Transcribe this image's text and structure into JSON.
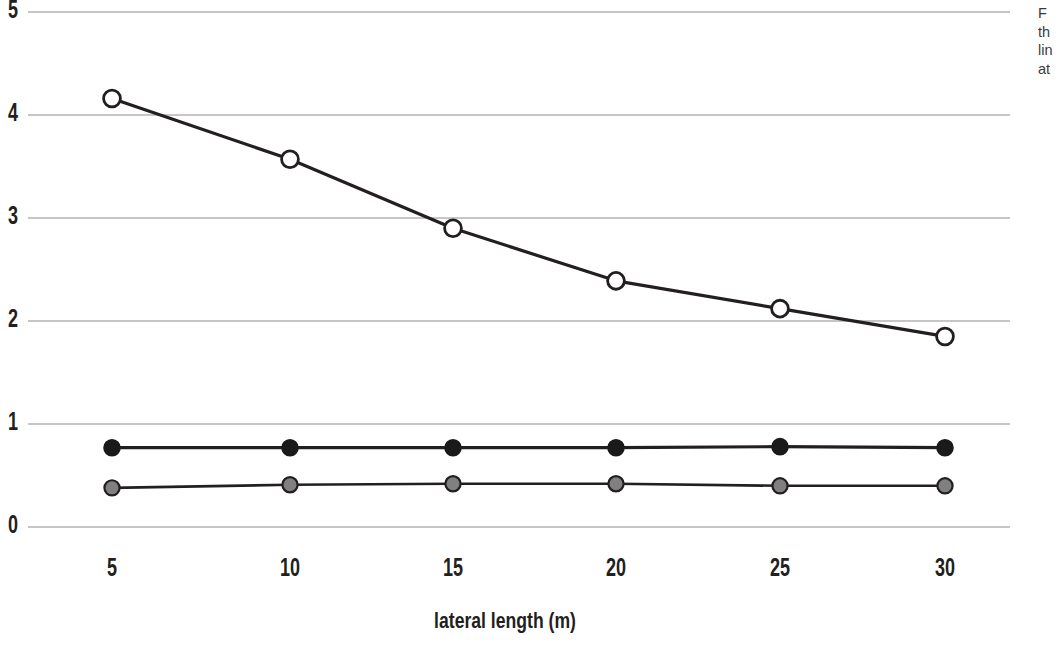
{
  "chart_data": {
    "type": "line",
    "title": "",
    "subtitle": "",
    "xlabel": "lateral length (m)",
    "ylabel": "",
    "x": [
      5,
      10,
      15,
      20,
      25,
      30
    ],
    "xtick_labels": [
      "5",
      "10",
      "15",
      "20",
      "25",
      "30"
    ],
    "ytick_labels": [
      "0",
      "1",
      "2",
      "3",
      "4",
      "5"
    ],
    "yticks": [
      0,
      1,
      2,
      3,
      4,
      5
    ],
    "xlim": [
      2.5,
      32.5
    ],
    "ylim": [
      0,
      5
    ],
    "grid": "horizontal",
    "legend": "none",
    "series": [
      {
        "name": "open-circle-series",
        "marker": "open-circle",
        "marker_fill": "#ffffff",
        "marker_stroke": "#231f20",
        "line_color": "#231f20",
        "values": [
          4.16,
          3.57,
          2.9,
          2.39,
          2.12,
          1.85
        ]
      },
      {
        "name": "filled-black-circle-series",
        "marker": "filled-circle",
        "marker_fill": "#1a1a1a",
        "marker_stroke": "#1a1a1a",
        "line_color": "#231f20",
        "values": [
          0.77,
          0.77,
          0.77,
          0.77,
          0.78,
          0.77
        ]
      },
      {
        "name": "filled-gray-circle-series",
        "marker": "filled-circle",
        "marker_fill": "#808080",
        "marker_stroke": "#231f20",
        "line_color": "#231f20",
        "values": [
          0.38,
          0.41,
          0.42,
          0.42,
          0.4,
          0.4
        ]
      }
    ]
  },
  "axis": {
    "x_title": "lateral length (m)"
  },
  "caption": {
    "lines": [
      "F",
      "th",
      "lin",
      "at"
    ]
  },
  "colors": {
    "gridline": "#b3b3b3",
    "ink": "#231f20",
    "marker_gray": "#808080",
    "marker_black": "#1a1a1a",
    "background": "#ffffff"
  }
}
